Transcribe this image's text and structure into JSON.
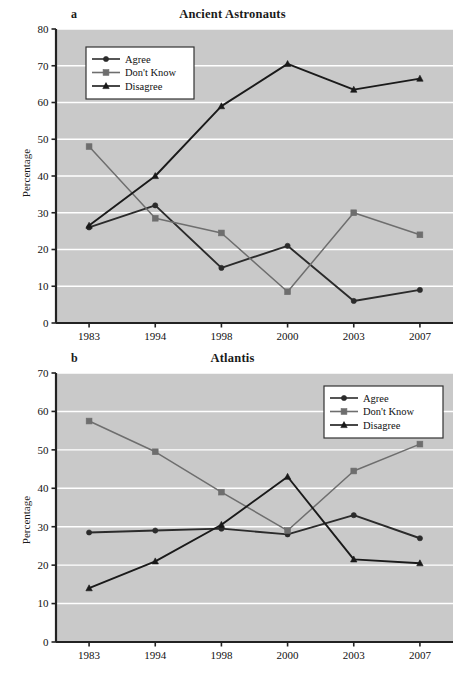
{
  "figure": {
    "ylabel": "Percentage",
    "series_names": [
      "Agree",
      "Don't Know",
      "Disagree"
    ],
    "colors": {
      "agree": "#2b2b2b",
      "dont_know": "#6e6e6e",
      "disagree": "#1a1a1a",
      "plot_background": "#c9c9c9",
      "gridline": "#ffffff",
      "axis": "#222222"
    }
  },
  "chart_data": [
    {
      "type": "line",
      "panel": "a",
      "title": "Ancient Astronauts",
      "xlabel": "",
      "ylabel": "Percentage",
      "categories": [
        "1983",
        "1994",
        "1998",
        "2000",
        "2003",
        "2007"
      ],
      "ylim": [
        0,
        80
      ],
      "yticks": [
        0,
        10,
        20,
        30,
        40,
        50,
        60,
        70,
        80
      ],
      "grid": true,
      "legend_position": "top-left",
      "series": [
        {
          "name": "Agree",
          "marker": "circle",
          "color": "#2b2b2b",
          "values": [
            26,
            32,
            15,
            21,
            6,
            9
          ]
        },
        {
          "name": "Don't Know",
          "marker": "square",
          "color": "#6e6e6e",
          "values": [
            48,
            28.5,
            24.5,
            8.5,
            30,
            24
          ]
        },
        {
          "name": "Disagree",
          "marker": "triangle",
          "color": "#1a1a1a",
          "values": [
            26.5,
            40,
            59,
            70.5,
            63.5,
            66.5
          ]
        }
      ]
    },
    {
      "type": "line",
      "panel": "b",
      "title": "Atlantis",
      "xlabel": "",
      "ylabel": "Percentage",
      "categories": [
        "1983",
        "1994",
        "1998",
        "2000",
        "2003",
        "2007"
      ],
      "ylim": [
        0,
        70
      ],
      "yticks": [
        0,
        10,
        20,
        30,
        40,
        50,
        60,
        70
      ],
      "grid": true,
      "legend_position": "top-right",
      "series": [
        {
          "name": "Agree",
          "marker": "circle",
          "color": "#2b2b2b",
          "values": [
            28.5,
            29,
            29.5,
            28,
            33,
            27
          ]
        },
        {
          "name": "Don't Know",
          "marker": "square",
          "color": "#6e6e6e",
          "values": [
            57.5,
            49.5,
            39,
            29,
            44.5,
            51.5
          ]
        },
        {
          "name": "Disagree",
          "marker": "triangle",
          "color": "#1a1a1a",
          "values": [
            14,
            21,
            30.5,
            43,
            21.5,
            20.5
          ]
        }
      ]
    }
  ]
}
